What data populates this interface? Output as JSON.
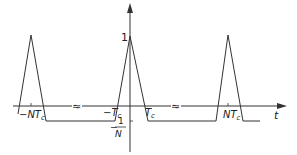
{
  "diagram": {
    "axis": {
      "x_label": "t",
      "y_peak_label": "1",
      "y_floor_label_num": "1",
      "y_floor_label_den": "N",
      "y_floor_label_sign": "−"
    },
    "ticks": {
      "neg_NTc": "−NT",
      "neg_NTc_sub": "c",
      "neg_Tc": "−T",
      "neg_Tc_sub": "c",
      "pos_Tc": "T",
      "pos_Tc_sub": "c",
      "pos_NTc": "NT",
      "pos_NTc_sub": "c"
    },
    "break_marks": [
      "≈",
      "≈"
    ],
    "colors": {
      "line": "#333333",
      "text": "#222222"
    }
  }
}
